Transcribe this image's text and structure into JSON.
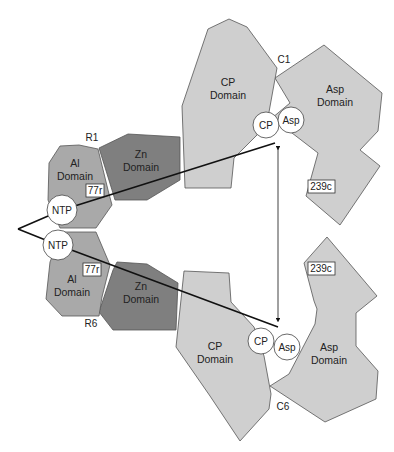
{
  "diagram": {
    "type": "protein-domain-schematic",
    "colors": {
      "light_domain": "#cfcfcf",
      "medium_domain": "#a9a9a9",
      "dark_domain": "#7f7f7f",
      "outline": "#555555",
      "line": "#111111",
      "background": "#ffffff"
    },
    "top": {
      "chain_labels": {
        "regulatory": "R1",
        "catalytic": "C1"
      },
      "al_domain": {
        "line1": "Al",
        "line2": "Domain"
      },
      "zn_domain": {
        "line1": "Zn",
        "line2": "Domain"
      },
      "cp_domain": {
        "line1": "CP",
        "line2": "Domain"
      },
      "asp_domain": {
        "line1": "Asp",
        "line2": "Domain"
      },
      "residue_al": "77r",
      "residue_asp": "239c",
      "site_ntp": "NTP",
      "site_cp": "CP",
      "site_asp": "Asp"
    },
    "bottom": {
      "chain_labels": {
        "regulatory": "R6",
        "catalytic": "C6"
      },
      "al_domain": {
        "line1": "Al",
        "line2": "Domain"
      },
      "zn_domain": {
        "line1": "Zn",
        "line2": "Domain"
      },
      "cp_domain": {
        "line1": "CP",
        "line2": "Domain"
      },
      "asp_domain": {
        "line1": "Asp",
        "line2": "Domain"
      },
      "residue_al": "77r",
      "residue_asp": "239c",
      "site_ntp": "NTP",
      "site_cp": "CP",
      "site_asp": "Asp"
    },
    "connectors": [
      {
        "name": "ntp-to-cp-top",
        "kind": "line"
      },
      {
        "name": "ntp-to-cp-bottom",
        "kind": "line"
      },
      {
        "name": "cp-cp-distance",
        "kind": "double-arrow"
      }
    ]
  }
}
